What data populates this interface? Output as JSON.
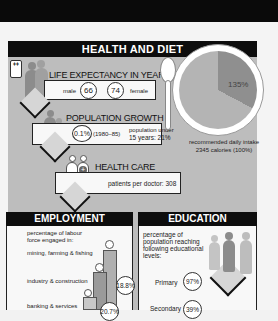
{
  "health_and_diet": {
    "title": "HEALTH AND DIET",
    "life_expectancy": {
      "title": "LIFE EXPECTANCY IN YEARS",
      "male_label": "male",
      "male_value": "66",
      "female_value": "74",
      "female_label": "female"
    },
    "population_growth": {
      "title": "POPULATION GROWTH",
      "rate": "0.1%",
      "period": "(1980–85)",
      "under15_label": "population under",
      "under15_value": "15 years: 21%"
    },
    "health_care": {
      "title": "HEALTH CARE",
      "patients_per_doctor": "patients per doctor: 308"
    },
    "diet": {
      "pie_percent": "135%",
      "intake_line1": "recommended daily intake",
      "intake_line2": "2345 calories (100%)"
    }
  },
  "employment": {
    "title": "EMPLOYMENT",
    "intro": "percentage of labour force engaged in:",
    "rows": [
      {
        "label": "mining, farming & fishing",
        "value": ""
      },
      {
        "label": "industry & construction",
        "value": "18.8%"
      },
      {
        "label": "banking & services",
        "value": "20.7%"
      }
    ]
  },
  "education": {
    "title": "EDUCATION",
    "intro": "percentage of population reaching following educational levels:",
    "rows": [
      {
        "label": "Primary",
        "value": "97%"
      },
      {
        "label": "Secondary",
        "value": "39%"
      }
    ]
  },
  "colors": {
    "header": "#0d0d0d",
    "panel": "#bdbdbd",
    "figure": "#8c8c8c"
  }
}
